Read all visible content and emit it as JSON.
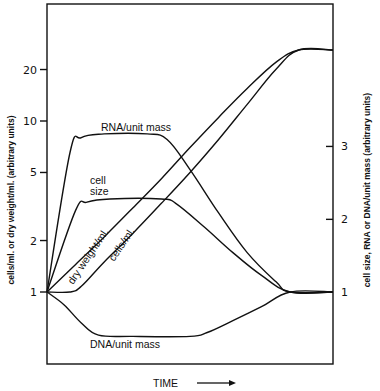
{
  "chart_data": {
    "type": "line",
    "title": "",
    "xlabel": "TIME",
    "ylabel_left": "cells/ml. or dry weight/ml. (arbitrary units)",
    "ylabel_right": "cell size, RNA or DNA/unit mass (arbitrary units)",
    "x_scale": "linear",
    "y_scale_left": "log",
    "xlim": [
      0,
      1
    ],
    "ylim_left": [
      0.38,
      48
    ],
    "left_ticks": [
      {
        "value": 1,
        "label": "1"
      },
      {
        "value": 2,
        "label": "2"
      },
      {
        "value": 5,
        "label": "5"
      },
      {
        "value": 10,
        "label": "10"
      },
      {
        "value": 20,
        "label": "20"
      }
    ],
    "right_ticks": [
      {
        "value": 1,
        "label": "1"
      },
      {
        "value": 2,
        "label": "2"
      },
      {
        "value": 3,
        "label": "3"
      }
    ],
    "right_ticks_left_equiv": [
      1,
      2.66,
      7.1
    ],
    "grid": false,
    "series": [
      {
        "name": "dry weight/ml.",
        "label": "dry weight/ml.",
        "x": [
          0,
          0.1,
          0.2,
          0.3,
          0.4,
          0.5,
          0.6,
          0.7,
          0.8,
          0.88,
          1.0
        ],
        "y": [
          1,
          1.45,
          2.1,
          3.1,
          4.6,
          7.0,
          10.5,
          15.5,
          22,
          26,
          26
        ]
      },
      {
        "name": "cells/ml.",
        "label": "cells/ml.",
        "x": [
          0,
          0.08,
          0.12,
          0.2,
          0.3,
          0.4,
          0.5,
          0.6,
          0.7,
          0.8,
          0.88,
          1.0
        ],
        "y": [
          1,
          1.0,
          1.08,
          1.5,
          2.2,
          3.3,
          5.0,
          7.8,
          12.5,
          20,
          26,
          26
        ]
      },
      {
        "name": "RNA/unit mass",
        "label": "RNA/unit mass",
        "x": [
          0,
          0.08,
          0.12,
          0.2,
          0.35,
          0.42,
          0.5,
          0.6,
          0.7,
          0.8,
          0.85,
          1.0
        ],
        "y": [
          1,
          6.5,
          8.0,
          8.4,
          8.4,
          7.8,
          5.2,
          2.9,
          1.7,
          1.15,
          1.0,
          1.0
        ]
      },
      {
        "name": "cell size",
        "label": "cell size",
        "x": [
          0,
          0.1,
          0.14,
          0.22,
          0.4,
          0.45,
          0.55,
          0.65,
          0.75,
          0.85,
          1.0
        ],
        "y": [
          1,
          3.0,
          3.35,
          3.5,
          3.5,
          3.3,
          2.4,
          1.7,
          1.25,
          1.0,
          1.0
        ]
      },
      {
        "name": "DNA/unit mass",
        "label": "DNA/unit mass",
        "x": [
          0,
          0.06,
          0.12,
          0.18,
          0.3,
          0.5,
          0.56,
          0.65,
          0.75,
          0.85,
          1.0
        ],
        "y": [
          1,
          0.84,
          0.66,
          0.56,
          0.55,
          0.55,
          0.58,
          0.68,
          0.82,
          1.0,
          1.0
        ]
      }
    ],
    "annotations": [
      {
        "text": "RNA/unit mass"
      },
      {
        "text": "cell"
      },
      {
        "text": "size"
      },
      {
        "text": "dry weight/ml."
      },
      {
        "text": "cells/ml."
      },
      {
        "text": "DNA/unit mass"
      }
    ],
    "x_arrow": "→"
  }
}
